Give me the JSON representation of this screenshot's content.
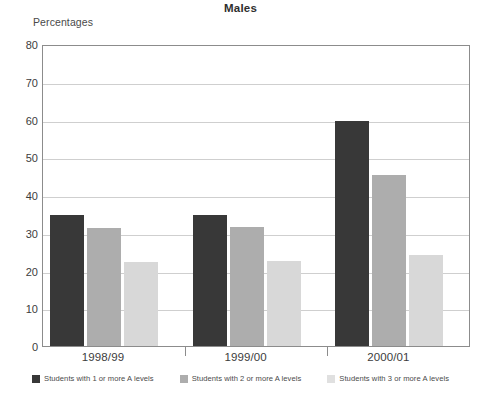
{
  "chart_data": {
    "type": "bar",
    "title": "Males",
    "xlabel": "",
    "ylabel": "Percentages",
    "categories": [
      "1998/99",
      "1999/00",
      "2000/01"
    ],
    "series": [
      {
        "name": "Students with 1 or more A levels",
        "color": "#383838",
        "values": [
          34.8,
          34.6,
          59.7
        ]
      },
      {
        "name": "Students with 2 or more A levels",
        "color": "#adadad",
        "values": [
          31.3,
          31.4,
          45.4
        ]
      },
      {
        "name": "Students with 3 or more A levels",
        "color": "#d8d8d8",
        "values": [
          22.3,
          22.6,
          24.0
        ]
      }
    ],
    "ylim": [
      0,
      80
    ],
    "yticks": [
      0,
      10,
      20,
      30,
      40,
      50,
      60,
      70,
      80
    ],
    "ytick_labels": [
      "0",
      "10",
      "20",
      "30",
      "40",
      "50",
      "60",
      "70",
      "80"
    ],
    "grid": true,
    "legend_position": "bottom"
  }
}
